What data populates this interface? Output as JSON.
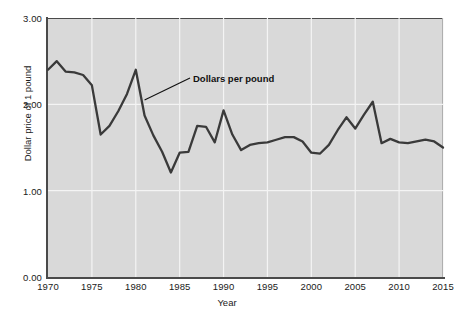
{
  "chart_data": {
    "type": "line",
    "title": "",
    "xlabel": "Year",
    "ylabel": "Dollar price of 1 pound",
    "xlim": [
      1970,
      2015
    ],
    "ylim": [
      0.0,
      3.0
    ],
    "xticks": [
      "1970",
      "1975",
      "1980",
      "1985",
      "1990",
      "1995",
      "2000",
      "2005",
      "2010",
      "2015"
    ],
    "yticks": [
      "0.00",
      "1.00",
      "2.00",
      "3.00"
    ],
    "grid": true,
    "legend": "none",
    "annotations": [
      {
        "label": "Dollars per pound",
        "points_at_year": 1981,
        "points_at_value": 2.05
      }
    ],
    "series": [
      {
        "name": "Dollars per pound",
        "color": "#3a3a3a",
        "x": [
          1970,
          1971,
          1972,
          1973,
          1974,
          1975,
          1976,
          1977,
          1978,
          1979,
          1980,
          1981,
          1982,
          1983,
          1984,
          1985,
          1986,
          1987,
          1988,
          1989,
          1990,
          1991,
          1992,
          1993,
          1994,
          1995,
          1996,
          1997,
          1998,
          1999,
          2000,
          2001,
          2002,
          2003,
          2004,
          2005,
          2006,
          2007,
          2008,
          2009,
          2010,
          2011,
          2012,
          2013,
          2014,
          2015
        ],
        "values": [
          2.4,
          2.5,
          2.38,
          2.37,
          2.34,
          2.22,
          1.65,
          1.75,
          1.92,
          2.12,
          2.4,
          1.87,
          1.64,
          1.45,
          1.21,
          1.44,
          1.45,
          1.75,
          1.74,
          1.56,
          1.93,
          1.65,
          1.47,
          1.53,
          1.55,
          1.56,
          1.59,
          1.62,
          1.62,
          1.57,
          1.44,
          1.43,
          1.53,
          1.7,
          1.85,
          1.72,
          1.88,
          2.03,
          1.55,
          1.6,
          1.56,
          1.55,
          1.57,
          1.59,
          1.57,
          1.5
        ]
      }
    ]
  },
  "axis": {
    "y_label": "Dollar price of 1 pound",
    "x_label": "Year"
  },
  "annotation": {
    "label": "Dollars per pound"
  },
  "colors": {
    "plot_background": "#d9d9d9",
    "gridline": "#f4f4f4",
    "line": "#3a3a3a",
    "axis": "#4a4a4a",
    "text": "#1a1a1a"
  }
}
